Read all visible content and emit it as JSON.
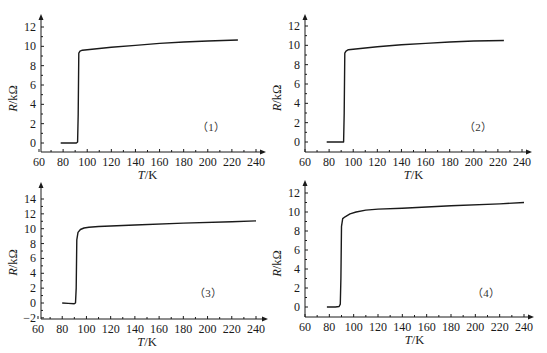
{
  "chart_data": [
    {
      "type": "line",
      "panel_label": "（1）",
      "xlabel": "T/K",
      "ylabel": "R/kΩ",
      "xlim": [
        60,
        245
      ],
      "ylim": [
        -1,
        13
      ],
      "xticks": [
        60,
        80,
        100,
        120,
        140,
        160,
        180,
        200,
        220,
        240
      ],
      "yticks": [
        0,
        2,
        4,
        6,
        8,
        10,
        12
      ],
      "grid": false,
      "x": [
        78,
        85,
        91,
        92,
        92.5,
        93,
        94,
        96,
        100,
        120,
        140,
        160,
        180,
        200,
        225
      ],
      "y": [
        0,
        0,
        0,
        0.1,
        3,
        9.3,
        9.5,
        9.6,
        9.65,
        9.9,
        10.1,
        10.3,
        10.45,
        10.55,
        10.65
      ]
    },
    {
      "type": "line",
      "panel_label": "（2）",
      "xlabel": "T/K",
      "ylabel": "R/kΩ",
      "xlim": [
        60,
        245
      ],
      "ylim": [
        -1,
        13
      ],
      "xticks": [
        60,
        80,
        100,
        120,
        140,
        160,
        180,
        200,
        220,
        240
      ],
      "yticks": [
        0,
        2,
        4,
        6,
        8,
        10,
        12
      ],
      "grid": false,
      "x": [
        78,
        85,
        92,
        92.5,
        93,
        94,
        96,
        100,
        120,
        140,
        160,
        180,
        200,
        225
      ],
      "y": [
        0,
        0,
        0,
        3,
        9.2,
        9.4,
        9.55,
        9.6,
        9.85,
        10.05,
        10.2,
        10.35,
        10.45,
        10.5
      ]
    },
    {
      "type": "line",
      "panel_label": "（3）",
      "xlabel": "T/K",
      "ylabel": "R/kΩ",
      "xlim": [
        60,
        245
      ],
      "ylim": [
        -2,
        15.5
      ],
      "xticks": [
        60,
        80,
        100,
        120,
        140,
        160,
        180,
        200,
        220,
        240
      ],
      "yticks": [
        -2,
        0,
        2,
        4,
        6,
        8,
        10,
        12,
        14
      ],
      "grid": false,
      "x": [
        80,
        85,
        90,
        91,
        91.5,
        92,
        93,
        95,
        98,
        102,
        110,
        140,
        180,
        220,
        240
      ],
      "y": [
        0,
        -0.05,
        -0.1,
        0,
        2,
        8.5,
        9.5,
        9.9,
        10.1,
        10.2,
        10.3,
        10.5,
        10.75,
        10.95,
        11.05
      ]
    },
    {
      "type": "line",
      "panel_label": "（4）",
      "xlabel": "T/K",
      "ylabel": "R/kΩ",
      "xlim": [
        60,
        245
      ],
      "ylim": [
        -1,
        13
      ],
      "xticks": [
        60,
        80,
        100,
        120,
        140,
        160,
        180,
        200,
        220,
        240
      ],
      "yticks": [
        0,
        2,
        4,
        6,
        8,
        10,
        12
      ],
      "grid": false,
      "x": [
        78,
        85,
        88,
        89,
        89.5,
        90,
        91,
        93,
        97,
        102,
        110,
        120,
        140,
        180,
        220,
        240
      ],
      "y": [
        0,
        0,
        0.05,
        0.3,
        3,
        8.5,
        9.3,
        9.5,
        9.8,
        10.0,
        10.2,
        10.3,
        10.4,
        10.65,
        10.85,
        11.0
      ]
    }
  ],
  "labels": {
    "xlabel_italic": "T",
    "xlabel_unit": "/K",
    "ylabel_italic": "R",
    "ylabel_unit": "/kΩ"
  }
}
